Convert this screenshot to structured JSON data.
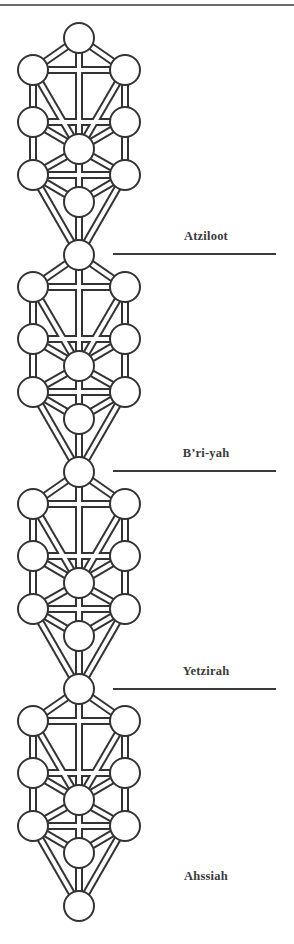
{
  "figure": {
    "stroke_color": "#333333",
    "fill_color": "#ffffff",
    "node_radius": 15,
    "columns": {
      "left": 33,
      "center": 79,
      "right": 125
    },
    "first_tree_top_y": 38,
    "tree_step_y": 217,
    "tree_count": 4,
    "node_offsets": [
      {
        "id": "keter",
        "col": "center",
        "dy": 0
      },
      {
        "id": "chokhmah",
        "col": "right",
        "dy": 32
      },
      {
        "id": "binah",
        "col": "left",
        "dy": 32
      },
      {
        "id": "chesed",
        "col": "right",
        "dy": 84
      },
      {
        "id": "gevurah",
        "col": "left",
        "dy": 84
      },
      {
        "id": "tiferet",
        "col": "center",
        "dy": 111
      },
      {
        "id": "netzach",
        "col": "right",
        "dy": 137
      },
      {
        "id": "hod",
        "col": "left",
        "dy": 137
      },
      {
        "id": "yesod",
        "col": "center",
        "dy": 164
      },
      {
        "id": "malkhut",
        "col": "center",
        "dy": 217
      }
    ],
    "paths": [
      [
        "keter",
        "chokhmah"
      ],
      [
        "keter",
        "binah"
      ],
      [
        "keter",
        "tiferet"
      ],
      [
        "chokhmah",
        "binah"
      ],
      [
        "chokhmah",
        "chesed"
      ],
      [
        "chokhmah",
        "tiferet"
      ],
      [
        "binah",
        "gevurah"
      ],
      [
        "binah",
        "tiferet"
      ],
      [
        "chesed",
        "gevurah"
      ],
      [
        "chesed",
        "tiferet"
      ],
      [
        "chesed",
        "netzach"
      ],
      [
        "gevurah",
        "tiferet"
      ],
      [
        "gevurah",
        "hod"
      ],
      [
        "tiferet",
        "netzach"
      ],
      [
        "tiferet",
        "hod"
      ],
      [
        "tiferet",
        "yesod"
      ],
      [
        "netzach",
        "hod"
      ],
      [
        "netzach",
        "yesod"
      ],
      [
        "netzach",
        "malkhut"
      ],
      [
        "hod",
        "yesod"
      ],
      [
        "hod",
        "malkhut"
      ],
      [
        "yesod",
        "malkhut"
      ]
    ]
  },
  "worlds": [
    {
      "name": "Atziloot",
      "label_x": 206,
      "label_y": 236,
      "divider": {
        "x1": 113,
        "x2": 276,
        "y": 254
      }
    },
    {
      "name": "B’ri-yah",
      "label_x": 206,
      "label_y": 453,
      "divider": {
        "x1": 113,
        "x2": 276,
        "y": 471
      }
    },
    {
      "name": "Yetzirah",
      "label_x": 206,
      "label_y": 671,
      "divider": {
        "x1": 113,
        "x2": 276,
        "y": 689
      }
    },
    {
      "name": "Ahssiah",
      "label_x": 206,
      "label_y": 876,
      "divider": null
    }
  ]
}
